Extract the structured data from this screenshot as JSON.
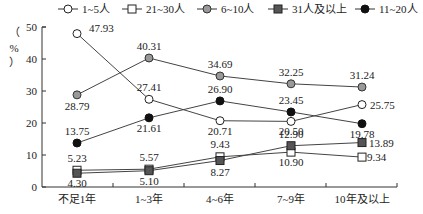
{
  "chart_data": {
    "type": "line",
    "title": "",
    "xlabel": "",
    "ylabel": "（%）",
    "ylim": [
      0,
      50
    ],
    "yticks": [
      0,
      10,
      20,
      30,
      40,
      50
    ],
    "grid": false,
    "legend_position": "top",
    "categories": [
      "不足1年",
      "1~3年",
      "4~6年",
      "7~9年",
      "10年及以上"
    ],
    "series": [
      {
        "name": "1~5人",
        "marker": "circle-open",
        "color": "#ffffff",
        "values": [
          47.93,
          27.41,
          20.71,
          20.5,
          25.75
        ]
      },
      {
        "name": "21~30人",
        "marker": "square-open",
        "color": "#ffffff",
        "values": [
          5.23,
          5.57,
          9.43,
          10.9,
          9.34
        ]
      },
      {
        "name": "6~10人",
        "marker": "circle-gray",
        "color": "#999999",
        "values": [
          28.79,
          40.31,
          34.69,
          32.25,
          31.24
        ]
      },
      {
        "name": "31人及以上",
        "marker": "square-gray",
        "color": "#555555",
        "values": [
          4.3,
          5.1,
          8.27,
          12.9,
          13.89
        ]
      },
      {
        "name": "11~20人",
        "marker": "circle-filled",
        "color": "#111111",
        "values": [
          13.75,
          21.61,
          26.9,
          23.45,
          19.78
        ]
      }
    ]
  }
}
